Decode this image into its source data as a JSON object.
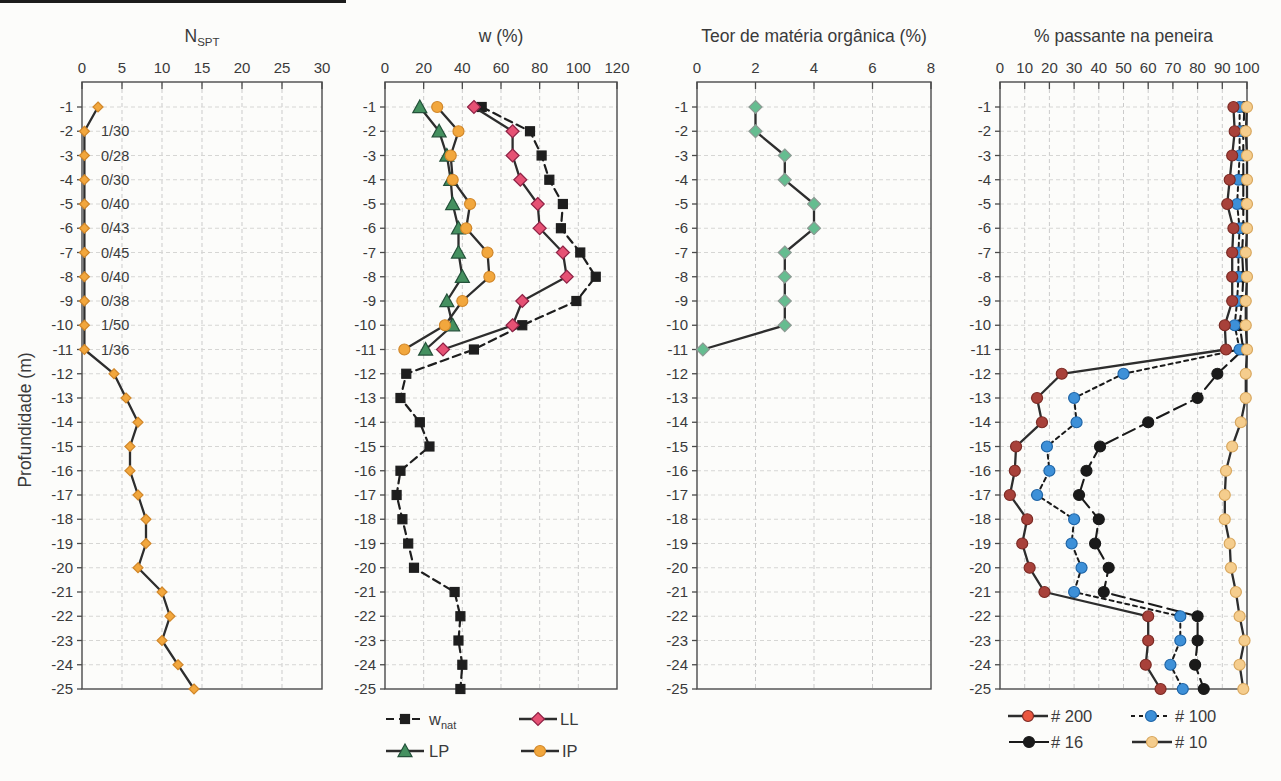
{
  "figure": {
    "ylabel": "Profundidade (m)",
    "depth_ticks": [
      -1,
      -2,
      -3,
      -4,
      -5,
      -6,
      -7,
      -8,
      -9,
      -10,
      -11,
      -12,
      -13,
      -14,
      -15,
      -16,
      -17,
      -18,
      -19,
      -20,
      -21,
      -22,
      -23,
      -24,
      -25
    ],
    "background": "#fcfcfa",
    "grid_color": "#cbcbcb",
    "axis_color": "#4a4a4a",
    "text_color": "#3a3a3a"
  },
  "chart_data": [
    {
      "type": "line",
      "id": "nspt",
      "orientation": "depth-profile",
      "title": {
        "text": "N",
        "sub": "SPT"
      },
      "xlim": [
        0,
        30
      ],
      "xticks": [
        0,
        5,
        10,
        15,
        20,
        25,
        30
      ],
      "grid": true,
      "series": [
        {
          "name": "nspt",
          "marker": "diamond",
          "ms": 5,
          "marker_fill": "#F2A73D",
          "marker_stroke": "#D1872A",
          "line_color": "#2D2D2D",
          "line_dash": "",
          "line_width": 2.3,
          "legend_slot": null,
          "points": [
            [
              -1,
              2
            ],
            [
              -2,
              0.3
            ],
            [
              -3,
              0.3
            ],
            [
              -4,
              0.3
            ],
            [
              -5,
              0.3
            ],
            [
              -6,
              0.3
            ],
            [
              -7,
              0.3
            ],
            [
              -8,
              0.3
            ],
            [
              -9,
              0.3
            ],
            [
              -10,
              0.3
            ],
            [
              -11,
              0.3
            ],
            [
              -12,
              4
            ],
            [
              -13,
              5.5
            ],
            [
              -14,
              7
            ],
            [
              -15,
              6
            ],
            [
              -16,
              6
            ],
            [
              -17,
              7
            ],
            [
              -18,
              8
            ],
            [
              -19,
              8
            ],
            [
              -20,
              7
            ],
            [
              -21,
              10
            ],
            [
              -22,
              11
            ],
            [
              -23,
              10
            ],
            [
              -24,
              12
            ],
            [
              -25,
              14
            ]
          ]
        }
      ],
      "annotations": [
        {
          "depth": -2,
          "label": "1/30"
        },
        {
          "depth": -3,
          "label": "0/28"
        },
        {
          "depth": -4,
          "label": "0/30"
        },
        {
          "depth": -5,
          "label": "0/40"
        },
        {
          "depth": -6,
          "label": "0/43"
        },
        {
          "depth": -7,
          "label": "0/45"
        },
        {
          "depth": -8,
          "label": "0/40"
        },
        {
          "depth": -9,
          "label": "0/38"
        },
        {
          "depth": -10,
          "label": "1/50"
        },
        {
          "depth": -11,
          "label": "1/36"
        }
      ]
    },
    {
      "type": "line",
      "id": "w",
      "orientation": "depth-profile",
      "title": {
        "text": "w (%)",
        "sub": ""
      },
      "xlim": [
        0,
        120
      ],
      "xticks": [
        0,
        20,
        40,
        60,
        80,
        100,
        120
      ],
      "grid": true,
      "series": [
        {
          "name": "w_nat",
          "legend_label": {
            "text": "w",
            "sub": "nat"
          },
          "marker": "square",
          "ms": 4.5,
          "marker_fill": "#1E1E1E",
          "marker_stroke": "#1E1E1E",
          "line_color": "#1E1E1E",
          "line_dash": "8 5",
          "line_width": 2.2,
          "legend_slot": 0,
          "legend_dash": "8 5",
          "points": [
            [
              -1,
              50
            ],
            [
              -2,
              75
            ],
            [
              -3,
              81
            ],
            [
              -4,
              85
            ],
            [
              -5,
              92
            ],
            [
              -6,
              91
            ],
            [
              -7,
              101
            ],
            [
              -8,
              109
            ],
            [
              -9,
              99
            ],
            [
              -10,
              71
            ],
            [
              -11,
              46
            ],
            [
              -12,
              11
            ],
            [
              -13,
              8
            ],
            [
              -14,
              18
            ],
            [
              -15,
              23
            ],
            [
              -16,
              8
            ],
            [
              -17,
              6
            ],
            [
              -18,
              9
            ],
            [
              -19,
              12
            ],
            [
              -20,
              15
            ],
            [
              -21,
              36
            ],
            [
              -22,
              39
            ],
            [
              -23,
              38
            ],
            [
              -24,
              40
            ],
            [
              -25,
              39
            ]
          ]
        },
        {
          "name": "ll",
          "legend_label": {
            "text": "LL",
            "sub": ""
          },
          "marker": "diamond",
          "ms": 6.5,
          "marker_fill": "#E65174",
          "marker_stroke": "#8E2346",
          "line_color": "#2D2D2D",
          "line_dash": "",
          "line_width": 2.3,
          "legend_slot": 1,
          "legend_dash": "",
          "points": [
            [
              -1,
              46
            ],
            [
              -2,
              66
            ],
            [
              -3,
              66
            ],
            [
              -4,
              70
            ],
            [
              -5,
              79
            ],
            [
              -6,
              80
            ],
            [
              -7,
              92
            ],
            [
              -8,
              94
            ],
            [
              -9,
              71
            ],
            [
              -10,
              66
            ],
            [
              -11,
              30
            ]
          ]
        },
        {
          "name": "lp",
          "legend_label": {
            "text": "LP",
            "sub": ""
          },
          "marker": "triangle",
          "ms": 7,
          "marker_fill": "#44905F",
          "marker_stroke": "#24513A",
          "line_color": "#2D2D2D",
          "line_dash": "",
          "line_width": 2.3,
          "legend_slot": 2,
          "legend_dash": "",
          "points": [
            [
              -1,
              18
            ],
            [
              -2,
              28
            ],
            [
              -3,
              32
            ],
            [
              -4,
              34
            ],
            [
              -5,
              35
            ],
            [
              -6,
              38
            ],
            [
              -7,
              38
            ],
            [
              -8,
              40
            ],
            [
              -9,
              32
            ],
            [
              -10,
              35
            ],
            [
              -11,
              21
            ]
          ]
        },
        {
          "name": "ip",
          "legend_label": {
            "text": "IP",
            "sub": ""
          },
          "marker": "circle",
          "ms": 5.5,
          "marker_fill": "#F2A73D",
          "marker_stroke": "#D1872A",
          "line_color": "#2D2D2D",
          "line_dash": "",
          "line_width": 2.3,
          "legend_slot": 3,
          "legend_dash": "",
          "points": [
            [
              -1,
              27
            ],
            [
              -2,
              38
            ],
            [
              -3,
              34
            ],
            [
              -4,
              35
            ],
            [
              -5,
              44
            ],
            [
              -6,
              42
            ],
            [
              -7,
              53
            ],
            [
              -8,
              54
            ],
            [
              -9,
              40
            ],
            [
              -10,
              31
            ],
            [
              -11,
              10
            ]
          ]
        }
      ],
      "annotations": []
    },
    {
      "type": "line",
      "id": "organic",
      "orientation": "depth-profile",
      "title": {
        "text": "Teor de matéria orgânica (%)",
        "sub": ""
      },
      "xlim": [
        0,
        8
      ],
      "xticks": [
        0,
        2,
        4,
        6,
        8
      ],
      "grid": true,
      "series": [
        {
          "name": "organic",
          "marker": "diamond",
          "ms": 6.5,
          "marker_fill": "#65BD90",
          "marker_stroke": "#8C9A93",
          "line_color": "#2D2D2D",
          "line_dash": "",
          "line_width": 2.3,
          "legend_slot": null,
          "points": [
            [
              -1,
              2
            ],
            [
              -2,
              2
            ],
            [
              -3,
              3
            ],
            [
              -4,
              3
            ],
            [
              -5,
              4
            ],
            [
              -6,
              4
            ],
            [
              -7,
              3
            ],
            [
              -8,
              3
            ],
            [
              -9,
              3
            ],
            [
              -10,
              3
            ],
            [
              -11,
              0.2
            ]
          ]
        }
      ],
      "annotations": []
    },
    {
      "type": "line",
      "id": "sieve",
      "orientation": "depth-profile",
      "title": {
        "text": "% passante na peneira",
        "sub": ""
      },
      "xlim": [
        0,
        100
      ],
      "xticks": [
        0,
        10,
        20,
        30,
        40,
        50,
        60,
        70,
        80,
        90,
        100
      ],
      "grid": true,
      "series": [
        {
          "name": "s16",
          "legend_label": {
            "text": "# 16",
            "sub": ""
          },
          "marker": "circle",
          "ms": 5.5,
          "marker_fill": "#1A1A1A",
          "marker_stroke": "#1A1A1A",
          "line_color": "#1A1A1A",
          "line_dash": "13 6",
          "line_width": 2.1,
          "legend_slot": 2,
          "legend_dash": "",
          "points": [
            [
              -1,
              99
            ],
            [
              -2,
              98.5
            ],
            [
              -3,
              98.5
            ],
            [
              -4,
              98.5
            ],
            [
              -5,
              98.5
            ],
            [
              -6,
              98.5
            ],
            [
              -7,
              98
            ],
            [
              -8,
              98.5
            ],
            [
              -9,
              98
            ],
            [
              -10,
              97
            ],
            [
              -11,
              98.5
            ],
            [
              -12,
              88
            ],
            [
              -13,
              80
            ],
            [
              -14,
              60
            ],
            [
              -15,
              40.5
            ],
            [
              -16,
              35
            ],
            [
              -17,
              32
            ],
            [
              -18,
              40
            ],
            [
              -19,
              38.5
            ],
            [
              -20,
              44
            ],
            [
              -21,
              42
            ],
            [
              -22,
              80
            ],
            [
              -23,
              80
            ],
            [
              -24,
              79
            ],
            [
              -25,
              82.5
            ]
          ]
        },
        {
          "name": "s100",
          "legend_label": {
            "text": "# 100",
            "sub": ""
          },
          "marker": "circle",
          "ms": 5.5,
          "marker_fill": "#3D90D8",
          "marker_stroke": "#1E64A6",
          "line_color": "#1A1A1A",
          "line_dash": "4 4",
          "line_width": 2,
          "legend_slot": 1,
          "legend_dash": "4 4",
          "points": [
            [
              -1,
              97
            ],
            [
              -2,
              97
            ],
            [
              -3,
              97
            ],
            [
              -4,
              96.5
            ],
            [
              -5,
              96
            ],
            [
              -6,
              97
            ],
            [
              -7,
              96.5
            ],
            [
              -8,
              96.5
            ],
            [
              -9,
              96
            ],
            [
              -10,
              95
            ],
            [
              -11,
              97
            ],
            [
              -12,
              50
            ],
            [
              -13,
              30
            ],
            [
              -14,
              31
            ],
            [
              -15,
              19
            ],
            [
              -16,
              20
            ],
            [
              -17,
              15
            ],
            [
              -18,
              30
            ],
            [
              -19,
              29
            ],
            [
              -20,
              33
            ],
            [
              -21,
              30
            ],
            [
              -22,
              73
            ],
            [
              -23,
              73
            ],
            [
              -24,
              69
            ],
            [
              -25,
              74
            ]
          ]
        },
        {
          "name": "s200",
          "legend_label": {
            "text": "# 200",
            "sub": ""
          },
          "marker": "circle",
          "ms": 5.5,
          "marker_fill": "#A8413A",
          "marker_stroke": "#7C2B25",
          "legend_fill": "#EA5740",
          "line_color": "#2D2D2D",
          "line_dash": "",
          "line_width": 2.3,
          "legend_slot": 0,
          "legend_dash": "",
          "points": [
            [
              -1,
              94.5
            ],
            [
              -2,
              95
            ],
            [
              -3,
              94
            ],
            [
              -4,
              93
            ],
            [
              -5,
              92
            ],
            [
              -6,
              94.5
            ],
            [
              -7,
              94
            ],
            [
              -8,
              94
            ],
            [
              -9,
              94
            ],
            [
              -10,
              91
            ],
            [
              -11,
              91.5
            ],
            [
              -12,
              25
            ],
            [
              -13,
              15
            ],
            [
              -14,
              17
            ],
            [
              -15,
              6.5
            ],
            [
              -16,
              6
            ],
            [
              -17,
              4
            ],
            [
              -18,
              11
            ],
            [
              -19,
              9
            ],
            [
              -20,
              12
            ],
            [
              -21,
              18
            ],
            [
              -22,
              60
            ],
            [
              -23,
              60
            ],
            [
              -24,
              59
            ],
            [
              -25,
              65
            ]
          ]
        },
        {
          "name": "s10",
          "legend_label": {
            "text": "# 10",
            "sub": ""
          },
          "marker": "circle",
          "ms": 5.5,
          "marker_fill": "#F5CD8D",
          "marker_stroke": "#D8A75E",
          "line_color": "#2D2D2D",
          "line_dash": "",
          "line_width": 2.3,
          "legend_slot": 3,
          "legend_dash": "",
          "points": [
            [
              -1,
              100
            ],
            [
              -2,
              99.5
            ],
            [
              -3,
              100
            ],
            [
              -4,
              100
            ],
            [
              -5,
              100
            ],
            [
              -6,
              100
            ],
            [
              -7,
              99.5
            ],
            [
              -8,
              100
            ],
            [
              -9,
              99.5
            ],
            [
              -10,
              99.5
            ],
            [
              -11,
              100
            ],
            [
              -12,
              99.5
            ],
            [
              -13,
              99.5
            ],
            [
              -14,
              97.5
            ],
            [
              -15,
              94
            ],
            [
              -16,
              91.5
            ],
            [
              -17,
              91
            ],
            [
              -18,
              91
            ],
            [
              -19,
              93
            ],
            [
              -20,
              93.5
            ],
            [
              -21,
              95.5
            ],
            [
              -22,
              97
            ],
            [
              -23,
              99
            ],
            [
              -24,
              97
            ],
            [
              -25,
              98.5
            ]
          ]
        }
      ],
      "annotations": []
    }
  ]
}
